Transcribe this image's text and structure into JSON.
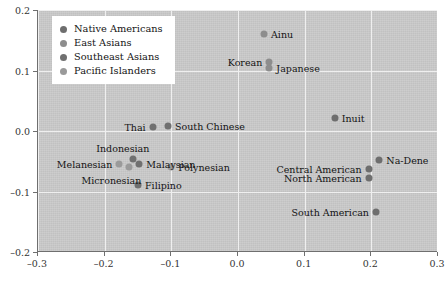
{
  "chart_data": {
    "type": "scatter",
    "title": "",
    "xlabel": "",
    "ylabel": "",
    "xlim": [
      -0.3,
      0.3
    ],
    "ylim": [
      -0.2,
      0.2
    ],
    "xticks": [
      "-0.3",
      "-0.2",
      "-0.1",
      "0.0",
      "0.1",
      "0.2",
      "0.3"
    ],
    "xtick_values": [
      -0.3,
      -0.2,
      -0.1,
      0.0,
      0.1,
      0.2,
      0.3
    ],
    "yticks": [
      "0.2",
      "0.1",
      "0.0",
      "-0.1",
      "-0.2"
    ],
    "ytick_values": [
      0.2,
      0.1,
      0.0,
      -0.1,
      -0.2
    ],
    "grid": true,
    "legend_position": "upper-left",
    "background_color": "#c9c9c9",
    "series": [
      {
        "name": "Native Americans",
        "color": "#6e6e6e",
        "points": [
          {
            "label": "Inuit",
            "x": 0.145,
            "y": 0.022,
            "label_side": "right"
          },
          {
            "label": "Na-Dene",
            "x": 0.212,
            "y": -0.048,
            "label_side": "right"
          },
          {
            "label": "Central American",
            "x": 0.196,
            "y": -0.062,
            "label_side": "left"
          },
          {
            "label": "North American",
            "x": 0.196,
            "y": -0.078,
            "label_side": "left"
          },
          {
            "label": "South American",
            "x": 0.207,
            "y": -0.134,
            "label_side": "left"
          }
        ]
      },
      {
        "name": "East Asians",
        "color": "#8d8d8d",
        "points": [
          {
            "label": "Ainu",
            "x": 0.039,
            "y": 0.16,
            "label_side": "right"
          },
          {
            "label": "Korean",
            "x": 0.047,
            "y": 0.114,
            "label_side": "left"
          },
          {
            "label": "Japanese",
            "x": 0.047,
            "y": 0.104,
            "label_side": "right"
          }
        ]
      },
      {
        "name": "Southeast Asians",
        "color": "#707070",
        "points": [
          {
            "label": "Thai",
            "x": -0.128,
            "y": 0.006,
            "label_side": "left"
          },
          {
            "label": "South Chinese",
            "x": -0.105,
            "y": 0.008,
            "label_side": "right"
          },
          {
            "label": "Indonesian",
            "x": -0.157,
            "y": -0.046,
            "label_side": "above-left"
          },
          {
            "label": "Malaysian",
            "x": -0.148,
            "y": -0.055,
            "label_side": "right"
          },
          {
            "label": "Filipino",
            "x": -0.15,
            "y": -0.09,
            "label_side": "right"
          }
        ]
      },
      {
        "name": "Pacific Islanders",
        "color": "#9a9a9a",
        "points": [
          {
            "label": "Melanesian",
            "x": -0.178,
            "y": -0.055,
            "label_side": "left"
          },
          {
            "label": "Micronesian",
            "x": -0.163,
            "y": -0.06,
            "label_side": "below-left"
          },
          {
            "label": "Polynesian",
            "x": -0.1,
            "y": -0.06,
            "label_side": "right"
          }
        ]
      }
    ]
  },
  "legend": {
    "items": [
      {
        "label": "Native Americans",
        "color": "#6e6e6e"
      },
      {
        "label": "East Asians",
        "color": "#8d8d8d"
      },
      {
        "label": "Southeast Asians",
        "color": "#707070"
      },
      {
        "label": "Pacific Islanders",
        "color": "#9a9a9a"
      }
    ]
  }
}
